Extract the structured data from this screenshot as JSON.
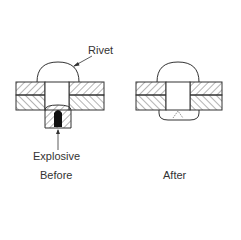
{
  "panels": [
    {
      "id": "before",
      "caption": "Before"
    },
    {
      "id": "after",
      "caption": "After"
    }
  ],
  "labels": {
    "rivet": "Rivet",
    "explosive": "Explosive",
    "before": "Before",
    "after": "After"
  },
  "colors": {
    "line": "#333333",
    "explosive": "#111111",
    "background": "#ffffff"
  }
}
